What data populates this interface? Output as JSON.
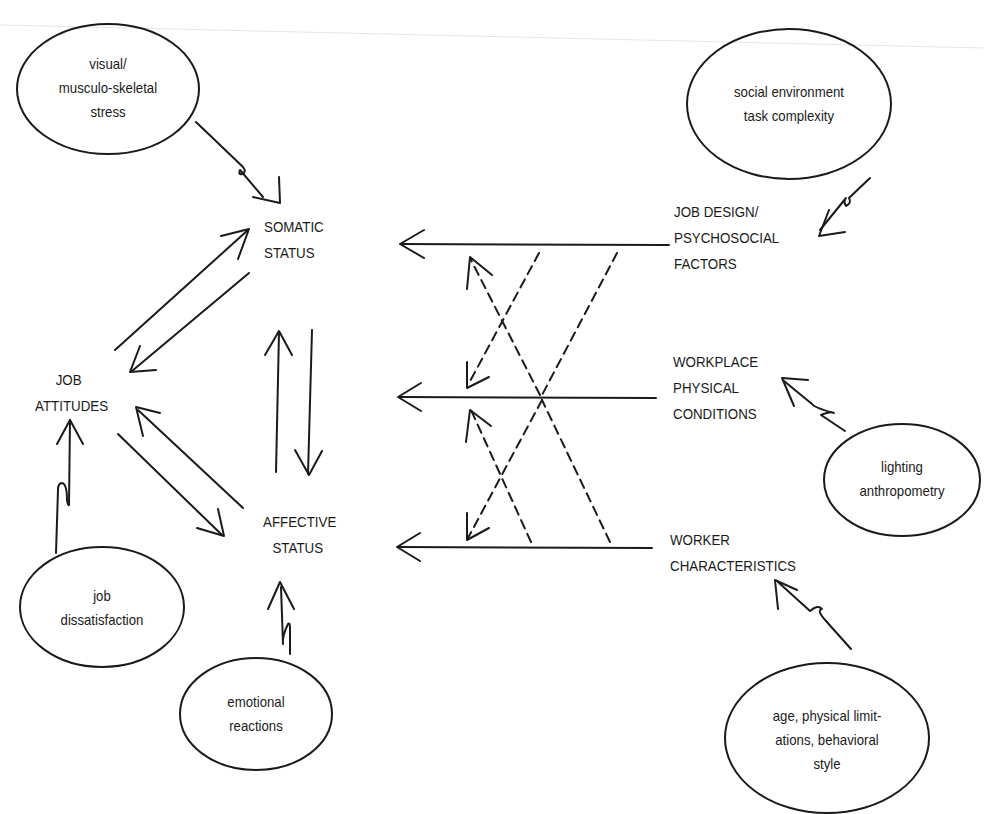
{
  "diagram": {
    "type": "causal model",
    "central_nodes": {
      "somatic_status": [
        "SOMATIC",
        "STATUS"
      ],
      "affective_status": [
        "AFFECTIVE",
        "STATUS"
      ],
      "job_attitudes": [
        "JOB",
        "ATTITUDES"
      ]
    },
    "right_factors": {
      "job_design": [
        "JOB DESIGN/",
        "PSYCHOSOCIAL",
        "FACTORS"
      ],
      "workplace": [
        "WORKPLACE",
        "PHYSICAL",
        "CONDITIONS"
      ],
      "worker": [
        "WORKER",
        "CHARACTERISTICS"
      ]
    },
    "outcomes": {
      "visual_stress": [
        "visual/",
        "musculo-skeletal",
        "stress"
      ],
      "job_dissatisfaction": [
        "job",
        "dissatisfaction"
      ],
      "emotional_reactions": [
        "emotional",
        "reactions"
      ]
    },
    "examples": {
      "social_env": [
        "social environment",
        "task complexity"
      ],
      "lighting": [
        "lighting",
        "anthropometry"
      ],
      "age": [
        "age, physical limit-",
        "ations, behavioral",
        "style"
      ]
    },
    "edges": [
      {
        "from": "JOB DESIGN/PSYCHOSOCIAL FACTORS",
        "to": "SOMATIC STATUS",
        "style": "solid"
      },
      {
        "from": "WORKPLACE PHYSICAL CONDITIONS",
        "to": "JOB ATTITUDES",
        "style": "solid"
      },
      {
        "from": "WORKER CHARACTERISTICS",
        "to": "AFFECTIVE STATUS",
        "style": "solid"
      },
      {
        "from": "JOB DESIGN/PSYCHOSOCIAL FACTORS",
        "to": "JOB ATTITUDES",
        "style": "dashed"
      },
      {
        "from": "JOB DESIGN/PSYCHOSOCIAL FACTORS",
        "to": "AFFECTIVE STATUS",
        "style": "dashed"
      },
      {
        "from": "WORKPLACE PHYSICAL CONDITIONS",
        "to": "SOMATIC STATUS",
        "style": "dashed"
      },
      {
        "from": "WORKPLACE PHYSICAL CONDITIONS",
        "to": "AFFECTIVE STATUS",
        "style": "dashed"
      },
      {
        "from": "WORKER CHARACTERISTICS",
        "to": "JOB ATTITUDES",
        "style": "dashed"
      },
      {
        "from": "WORKER CHARACTERISTICS",
        "to": "SOMATIC STATUS",
        "style": "dashed"
      },
      {
        "from": "SOMATIC STATUS",
        "to": "AFFECTIVE STATUS",
        "style": "solid"
      },
      {
        "from": "AFFECTIVE STATUS",
        "to": "SOMATIC STATUS",
        "style": "solid"
      },
      {
        "from": "SOMATIC STATUS",
        "to": "JOB ATTITUDES",
        "style": "solid"
      },
      {
        "from": "JOB ATTITUDES",
        "to": "SOMATIC STATUS",
        "style": "solid"
      },
      {
        "from": "AFFECTIVE STATUS",
        "to": "JOB ATTITUDES",
        "style": "solid"
      },
      {
        "from": "JOB ATTITUDES",
        "to": "AFFECTIVE STATUS",
        "style": "solid"
      },
      {
        "from": "visual/musculo-skeletal stress",
        "to": "SOMATIC STATUS",
        "style": "zigzag"
      },
      {
        "from": "job dissatisfaction",
        "to": "JOB ATTITUDES",
        "style": "zigzag"
      },
      {
        "from": "emotional reactions",
        "to": "AFFECTIVE STATUS",
        "style": "zigzag"
      },
      {
        "from": "social environment task complexity",
        "to": "JOB DESIGN/PSYCHOSOCIAL FACTORS",
        "style": "zigzag"
      },
      {
        "from": "lighting anthropometry",
        "to": "WORKPLACE PHYSICAL CONDITIONS",
        "style": "zigzag"
      },
      {
        "from": "age, physical limitations, behavioral style",
        "to": "WORKER CHARACTERISTICS",
        "style": "zigzag"
      }
    ],
    "colors": {
      "ink": "#1a1a1a",
      "background": "#ffffff"
    }
  }
}
